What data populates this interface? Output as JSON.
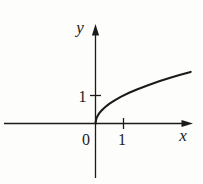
{
  "colors": {
    "ink": "#1b1b1b",
    "background": "#fdfdfc"
  },
  "chart_data": {
    "type": "line",
    "function": "y = sqrt(x)",
    "title": "",
    "xlabel": "x",
    "ylabel": "y",
    "origin_label": "0",
    "x_ticks": [
      {
        "value": 1,
        "label": "1"
      }
    ],
    "y_ticks": [
      {
        "value": 1,
        "label": "1"
      }
    ],
    "x_range": [
      0,
      3.4
    ],
    "y_range": [
      0,
      1.85
    ],
    "grid": false,
    "legend": false,
    "points": [
      [
        0,
        0
      ],
      [
        0.02,
        0.141
      ],
      [
        0.05,
        0.224
      ],
      [
        0.1,
        0.316
      ],
      [
        0.15,
        0.387
      ],
      [
        0.2,
        0.447
      ],
      [
        0.3,
        0.548
      ],
      [
        0.4,
        0.632
      ],
      [
        0.5,
        0.707
      ],
      [
        0.7,
        0.837
      ],
      [
        0.9,
        0.949
      ],
      [
        1.2,
        1.095
      ],
      [
        1.5,
        1.225
      ],
      [
        1.9,
        1.378
      ],
      [
        2.3,
        1.517
      ],
      [
        2.7,
        1.643
      ],
      [
        3.0,
        1.732
      ],
      [
        3.4,
        1.844
      ]
    ]
  }
}
